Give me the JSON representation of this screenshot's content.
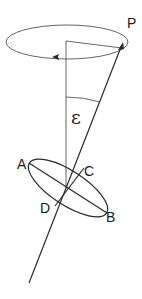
{
  "diagram": {
    "type": "precession-of-axis",
    "labels": {
      "pole": "P",
      "angle": "ε",
      "point_a": "A",
      "point_b": "B",
      "point_c": "C",
      "point_d": "D"
    },
    "colors": {
      "line": "#2a2a2a",
      "background": "#ffffff"
    }
  }
}
